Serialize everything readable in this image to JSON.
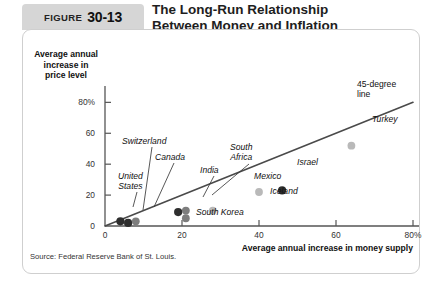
{
  "header": {
    "figure_word": "FIGURE",
    "figure_number": "30-13",
    "title_line1": "The Long-Run Relationship",
    "title_line2": "Between Money and Inflation"
  },
  "source": "Source: Federal Reserve Bank of St. Louis.",
  "annotations": {
    "line_label_1": "45-degree",
    "line_label_2": "line"
  },
  "colors": {
    "dark_point": "#2e2e2e",
    "mid_point": "#7d7d7d",
    "light_point": "#b9b9b9",
    "line": "#4a4a4a",
    "axis": "#555555",
    "tab_bg": "#d6d6d6",
    "panel_border": "#cfcfcf"
  },
  "chart_data": {
    "type": "scatter",
    "title": "The Long-Run Relationship Between Money and Inflation",
    "xlabel": "Average annual increase in money supply",
    "ylabel": "Average annual increase in price level",
    "xlim": [
      0,
      80
    ],
    "ylim": [
      0,
      88
    ],
    "xticks": [
      "0",
      "20",
      "40",
      "60",
      "80%"
    ],
    "xtick_values": [
      0,
      20,
      40,
      60,
      80
    ],
    "yticks": [
      "0",
      "20",
      "40",
      "60",
      "80%"
    ],
    "ytick_values": [
      0,
      20,
      40,
      60,
      80
    ],
    "grid": false,
    "legend": false,
    "reference_line": {
      "label": "45-degree line",
      "slope": 1,
      "intercept": 0,
      "x_range": [
        0,
        80
      ]
    },
    "points": [
      {
        "name": "United States",
        "x": 4,
        "y": 3,
        "shade": "dark"
      },
      {
        "name": "Switzerland",
        "x": 6,
        "y": 2,
        "shade": "dark"
      },
      {
        "name": "Canada",
        "x": 8,
        "y": 3,
        "shade": "mid"
      },
      {
        "name": "India",
        "x": 19,
        "y": 9,
        "shade": "dark"
      },
      {
        "name": "South Africa",
        "x": 21,
        "y": 10,
        "shade": "mid"
      },
      {
        "name": "South Korea",
        "x": 21,
        "y": 5,
        "shade": "mid"
      },
      {
        "name": "Iceland",
        "x": 28,
        "y": 10,
        "shade": "light"
      },
      {
        "name": "Mexico",
        "x": 40,
        "y": 22,
        "shade": "light"
      },
      {
        "name": "Israel",
        "x": 46,
        "y": 23,
        "shade": "dark"
      },
      {
        "name": "Turkey",
        "x": 64,
        "y": 52,
        "shade": "light"
      }
    ]
  }
}
